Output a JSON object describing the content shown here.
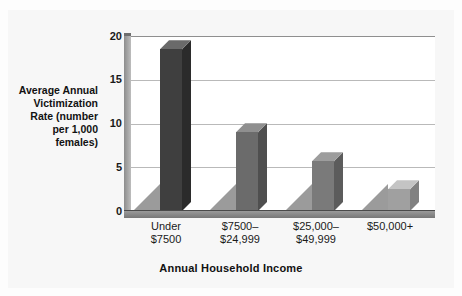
{
  "chart_data": {
    "type": "bar",
    "title": "",
    "subtitle": "",
    "xlabel": "Annual Household Income",
    "ylabel": "Average Annual Victimization Rate (number per 1,000 females)",
    "ylabel_lines": [
      "Average Annual",
      "Victimization",
      "Rate",
      "(number per",
      "1,000 females)"
    ],
    "categories": [
      "Under $7500",
      "$7500–$24,999",
      "$25,000–$49,999",
      "$50,000+"
    ],
    "category_lines": [
      [
        "Under",
        "$7500"
      ],
      [
        "$7500–",
        "$24,999"
      ],
      [
        "$25,000–",
        "$49,999"
      ],
      [
        "$50,000+",
        ""
      ]
    ],
    "values": [
      18.5,
      9.0,
      5.7,
      2.5
    ],
    "ylim": [
      0,
      20
    ],
    "yticks": [
      0,
      5,
      10,
      15,
      20
    ],
    "ytick_labels": [
      "0",
      "5",
      "10",
      "15",
      "20"
    ],
    "grid": true,
    "legend": "none",
    "style": "3d-bars",
    "bar_colors": [
      "#3f3f3f",
      "#6b6b6b",
      "#7a7a7a",
      "#a0a0a0"
    ],
    "bar_top_colors": [
      "#6a6a6a",
      "#8f8f8f",
      "#9d9d9d",
      "#c4c4c4"
    ],
    "bar_side_colors": [
      "#2b2b2b",
      "#4f4f4f",
      "#5c5c5c",
      "#818181"
    ],
    "shadow_color": "#9b9b9b"
  },
  "figure": {
    "background_color": "#fdfdfd",
    "panel_color": "#f7f7f7",
    "plot_background": "#ffffff",
    "gridline_color": "#b9b9b9",
    "floor_color": "#8a8a8a"
  }
}
